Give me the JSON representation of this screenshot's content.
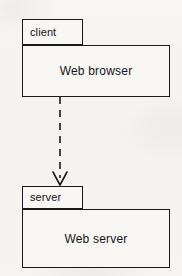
{
  "diagram": {
    "notation": "UML package diagram",
    "background_color": "#f6f5f2",
    "stroke_color": "#1a1a1a"
  },
  "packages": [
    {
      "id": "client",
      "tab_label": "client",
      "body_label": "Web browser",
      "x": 22,
      "y": 19,
      "tab_width": 61,
      "tab_height": 26,
      "body_width": 148,
      "body_height": 52
    },
    {
      "id": "server",
      "tab_label": "server",
      "body_label": "Web server",
      "x": 22,
      "y": 186,
      "tab_width": 61,
      "tab_height": 23,
      "body_width": 148,
      "body_height": 59
    }
  ],
  "connector": {
    "name": "dependency",
    "style": "dashed",
    "arrowhead": "open",
    "from": "client",
    "to": "server",
    "x": 60,
    "y_start": 97,
    "y_end": 186,
    "label": ""
  }
}
